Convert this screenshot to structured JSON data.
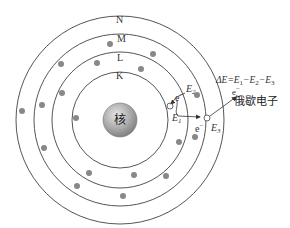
{
  "diagram": {
    "title": "",
    "nucleus": {
      "label": "核",
      "cx": 120,
      "cy": 120,
      "r": 17
    },
    "shells": [
      {
        "label": "K",
        "r": 48
      },
      {
        "label": "L",
        "r": 68
      },
      {
        "label": "M",
        "r": 86
      },
      {
        "label": "N",
        "r": 104
      }
    ],
    "annotations": {
      "e2": "E",
      "e2_sub": "2",
      "e1": "E",
      "e1_sub": "1",
      "e3": "E",
      "e3_sub": "3",
      "electron_top": "e",
      "electron_top_sup": "−",
      "electron_bottom": "e",
      "electron_bottom_sup": "−",
      "electron_auger": "e",
      "electron_auger_sup": "−",
      "auger_label": "俄歇电子",
      "equation": {
        "delta": "ΔE=E",
        "s1": "1",
        "mid1": "−E",
        "s2": "2",
        "mid2": "−E",
        "s3": "3"
      }
    },
    "colors": {
      "orbit": "#555555",
      "electron": "#888888",
      "nucleus_light": "#d8d8d8",
      "nucleus_dark": "#8a8a8a",
      "text": "#333333"
    }
  }
}
